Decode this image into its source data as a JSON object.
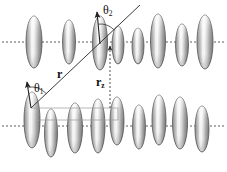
{
  "figure": {
    "type": "scientific-diagram",
    "width": 227,
    "height": 172,
    "background_color": "#ffffff"
  },
  "labels": {
    "theta1": {
      "symbol": "θ",
      "subscript": "1",
      "x": 34,
      "y": 82,
      "font_size": 12
    },
    "theta2": {
      "symbol": "θ",
      "subscript": "2",
      "x": 103,
      "y": 4,
      "font_size": 12
    },
    "r_vector": {
      "symbol": "r",
      "subscript": "",
      "x": 57,
      "y": 68,
      "font_size": 12
    },
    "rz_vector": {
      "symbol": "r",
      "subscript": "z",
      "x": 96,
      "y": 76,
      "font_size": 12
    }
  },
  "colors": {
    "molecule_outline": "#555555",
    "molecule_light": "#f2f2f2",
    "molecule_mid": "#b9b9b9",
    "molecule_dark": "#7d7d7d",
    "axis_line": "#4a4a4a",
    "vector_line": "#3a3a3a",
    "guide_line": "#9a9a9a",
    "label_text": "#111111"
  },
  "geometry": {
    "top_layer_axis_y": 42,
    "bottom_layer_axis_y": 126,
    "dotted_axis_dash": "2,2",
    "r_vector": {
      "x1": 31,
      "y1": 108,
      "x2": 140,
      "y2": 5
    },
    "rz_vector": {
      "x1": 110,
      "y1": 108,
      "x2": 110,
      "y2": 46
    },
    "theta1_arrow": {
      "x1": 31,
      "y1": 108,
      "x2": 27,
      "y2": 82
    },
    "theta2_arrow": {
      "x1": 100,
      "y1": 44,
      "x2": 97,
      "y2": 12
    },
    "guide_h1": {
      "x1": 31,
      "y1": 108,
      "x2": 118,
      "y2": 108
    },
    "guide_h2": {
      "x1": 38,
      "y1": 120,
      "x2": 118,
      "y2": 120
    }
  },
  "molecules": {
    "count_top": 8,
    "count_bottom": 9,
    "top_row": [
      {
        "cx": 34,
        "cy": 42,
        "rx": 8.0,
        "ry": 26
      },
      {
        "cx": 69,
        "cy": 42,
        "rx": 6.5,
        "ry": 22
      },
      {
        "cx": 100,
        "cy": 43,
        "rx": 7.5,
        "ry": 27
      },
      {
        "cx": 118,
        "cy": 45,
        "rx": 6.0,
        "ry": 19
      },
      {
        "cx": 138,
        "cy": 46,
        "rx": 6.0,
        "ry": 18
      },
      {
        "cx": 158,
        "cy": 41,
        "rx": 7.5,
        "ry": 27
      },
      {
        "cx": 182,
        "cy": 45,
        "rx": 6.5,
        "ry": 21
      },
      {
        "cx": 205,
        "cy": 42,
        "rx": 8.0,
        "ry": 27
      }
    ],
    "bottom_row": [
      {
        "cx": 32,
        "cy": 120,
        "rx": 8.0,
        "ry": 28
      },
      {
        "cx": 51,
        "cy": 133,
        "rx": 6.5,
        "ry": 24
      },
      {
        "cx": 75,
        "cy": 128,
        "rx": 7.5,
        "ry": 25
      },
      {
        "cx": 98,
        "cy": 126,
        "rx": 7.0,
        "ry": 27
      },
      {
        "cx": 117,
        "cy": 121,
        "rx": 7.0,
        "ry": 24
      },
      {
        "cx": 139,
        "cy": 127,
        "rx": 6.5,
        "ry": 22
      },
      {
        "cx": 159,
        "cy": 120,
        "rx": 7.0,
        "ry": 25
      },
      {
        "cx": 180,
        "cy": 123,
        "rx": 7.5,
        "ry": 26
      },
      {
        "cx": 202,
        "cy": 129,
        "rx": 7.0,
        "ry": 23
      }
    ]
  },
  "axes": {
    "top_axis": {
      "x1": 2,
      "y1": 42,
      "x2": 225,
      "y2": 42
    },
    "bottom_axis": {
      "x1": 2,
      "y1": 126,
      "x2": 225,
      "y2": 126
    }
  }
}
